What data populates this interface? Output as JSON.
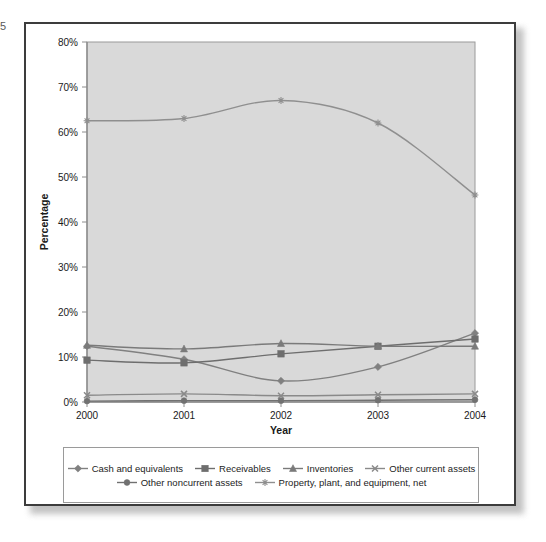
{
  "page_number": "5",
  "chart_data": {
    "type": "line",
    "title": "",
    "xlabel": "Year",
    "ylabel": "Percentage",
    "categories": [
      "2000",
      "2001",
      "2002",
      "2003",
      "2004"
    ],
    "x": [
      2000,
      2001,
      2002,
      2003,
      2004
    ],
    "xlim": [
      2000,
      2004
    ],
    "ylim": [
      0,
      80
    ],
    "ytick_labels": [
      "0%",
      "10%",
      "20%",
      "30%",
      "40%",
      "50%",
      "60%",
      "70%",
      "80%"
    ],
    "ytick_values": [
      0,
      10,
      20,
      30,
      40,
      50,
      60,
      70,
      80
    ],
    "grid": false,
    "legend_position": "bottom",
    "plot_background": "#d9d9d9",
    "series": [
      {
        "name": "Cash and equivalents",
        "marker": "diamond",
        "color": "#808080",
        "values": [
          12.4,
          9.5,
          4.7,
          7.8,
          15.3
        ]
      },
      {
        "name": "Receivables",
        "marker": "square",
        "color": "#6e6e6e",
        "values": [
          9.3,
          8.7,
          10.7,
          12.4,
          14.0
        ]
      },
      {
        "name": "Inventories",
        "marker": "triangle",
        "color": "#7a7a7a",
        "values": [
          12.6,
          11.8,
          13.0,
          12.4,
          12.4
        ]
      },
      {
        "name": "Other current assets",
        "marker": "cross",
        "color": "#8a8a8a",
        "values": [
          1.5,
          1.8,
          1.4,
          1.6,
          1.8
        ]
      },
      {
        "name": "Other noncurrent assets",
        "marker": "circle",
        "color": "#717171",
        "values": [
          0.2,
          0.3,
          0.3,
          0.4,
          0.5
        ]
      },
      {
        "name": "Property, plant, and equipment, net",
        "marker": "star",
        "color": "#8f8f8f",
        "values": [
          62.5,
          63.0,
          67.0,
          62.0,
          46.0
        ]
      }
    ]
  },
  "legend": {
    "row1": [
      {
        "label": "Cash and equivalents",
        "marker": "diamond"
      },
      {
        "label": "Receivables",
        "marker": "square"
      },
      {
        "label": "Inventories",
        "marker": "triangle"
      },
      {
        "label": "Other current assets",
        "marker": "cross"
      }
    ],
    "row2": [
      {
        "label": "Other noncurrent assets",
        "marker": "circle"
      },
      {
        "label": "Property, plant, and equipment, net",
        "marker": "star"
      }
    ]
  }
}
